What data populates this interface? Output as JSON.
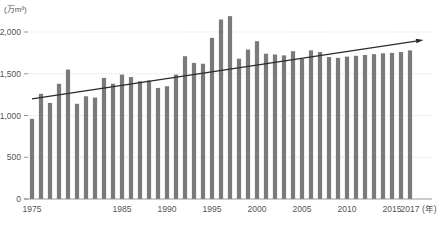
{
  "chart_data": {
    "type": "bar",
    "title": "",
    "subtitle": "",
    "xlabel": "(年)",
    "ylabel": "(万m³)",
    "ylim": [
      0,
      2200
    ],
    "yticks": [
      0,
      500,
      1000,
      1500,
      2000
    ],
    "ytick_labels": [
      "0",
      "500",
      "1,000",
      "1,500",
      "2,000"
    ],
    "grid": true,
    "legend": "none",
    "bar_color": "#7a7a7a",
    "trend_color": "#2b2b2b",
    "grid_color": "#cfcfcf",
    "axis_color": "#8a8a8a",
    "x": [
      1975,
      1976,
      1977,
      1978,
      1979,
      1980,
      1981,
      1982,
      1983,
      1984,
      1985,
      1986,
      1987,
      1988,
      1989,
      1990,
      1991,
      1992,
      1993,
      1994,
      1995,
      1996,
      1997,
      1998,
      1999,
      2000,
      2001,
      2002,
      2003,
      2004,
      2005,
      2006,
      2007,
      2008,
      2009,
      2010,
      2011,
      2012,
      2013,
      2014,
      2015,
      2016,
      2017
    ],
    "categories": [
      "1975",
      "1976",
      "1977",
      "1978",
      "1979",
      "1980",
      "1981",
      "1982",
      "1983",
      "1984",
      "1985",
      "1986",
      "1987",
      "1988",
      "1989",
      "1990",
      "1991",
      "1992",
      "1993",
      "1994",
      "1995",
      "1996",
      "1997",
      "1998",
      "1999",
      "2000",
      "2001",
      "2002",
      "2003",
      "2004",
      "2005",
      "2006",
      "2007",
      "2008",
      "2009",
      "2010",
      "2011",
      "2012",
      "2013",
      "2014",
      "2015",
      "2016",
      "2017"
    ],
    "values": [
      960,
      1260,
      1150,
      1380,
      1550,
      1140,
      1230,
      1215,
      1450,
      1380,
      1490,
      1460,
      1410,
      1420,
      1330,
      1350,
      1490,
      1710,
      1630,
      1620,
      1930,
      2150,
      2190,
      1680,
      1790,
      1890,
      1740,
      1730,
      1720,
      1770,
      1680,
      1780,
      1760,
      1700,
      1690,
      1705,
      1715,
      1725,
      1735,
      1745,
      1750,
      1760,
      1780
    ],
    "xtick_labels": [
      "1975",
      "1985",
      "1990",
      "1995",
      "2000",
      "2005",
      "2010",
      "2015",
      "2017"
    ],
    "xtick_years": [
      1975,
      1985,
      1990,
      1995,
      2000,
      2005,
      2010,
      2015,
      2017
    ],
    "trend": {
      "type": "arrow",
      "start": {
        "year": 1975,
        "value": 1200
      },
      "end": {
        "year": 2018.5,
        "value": 1905
      }
    }
  }
}
